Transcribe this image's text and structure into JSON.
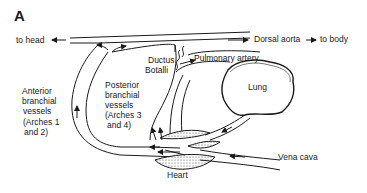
{
  "figure": {
    "panel_label": "A",
    "labels": {
      "to_head": "to head",
      "dorsal_aorta": "Dorsal aorta",
      "to_body": "to body",
      "ductus_line1": "Ductus",
      "ductus_line2": "Botalli",
      "pulmonary_artery": "Pulmonary artery",
      "lung": "Lung",
      "posterior_line1": "Posterior",
      "posterior_line2": "branchial",
      "posterior_line3": "vessels",
      "posterior_line4": "(Arches 3",
      "posterior_line5": "and 4)",
      "anterior_line1": "Anterior",
      "anterior_line2": "branchial",
      "anterior_line3": "vessels",
      "anterior_line4": "(Arches 1",
      "anterior_line5": "and 2)",
      "vena_cava": "Vena cava",
      "heart": "Heart"
    },
    "colors": {
      "line": "#1a1a1a",
      "background": "#ffffff"
    }
  }
}
